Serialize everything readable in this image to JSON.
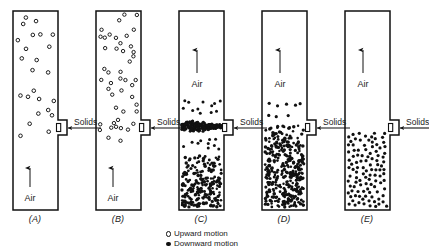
{
  "figure": {
    "background": "#ffffff",
    "ink_color": "#1a1a1a",
    "wall_color": "#111111"
  },
  "legend": {
    "items": [
      {
        "marker": "open-circle",
        "label": "Upward motion"
      },
      {
        "marker": "filled-circle",
        "label": "Downward motion"
      }
    ]
  },
  "labels": {
    "air": "Air",
    "solids": "Solids"
  },
  "panels": [
    {
      "id": "A",
      "caption": "(A)",
      "vessel": {
        "x": 13,
        "y": 11,
        "width": 45,
        "height": 199
      },
      "notch": {
        "x": 58,
        "y": 120,
        "width": 9,
        "height": 15
      },
      "solids_label": {
        "x": 74,
        "y": 117
      },
      "solids_line": {
        "x1": 67,
        "y1": 128,
        "x2": 101,
        "y2": 128
      },
      "air_arrow": {
        "x": 30,
        "y1": 196,
        "y2": 168
      },
      "air_label": {
        "x": 30,
        "y": 196
      },
      "caption_pos": {
        "x": 35,
        "y": 214
      },
      "particles": {
        "style": "open",
        "regions": [
          {
            "type": "sparse",
            "x": 14,
            "y": 12,
            "width": 43,
            "height": 128,
            "count": 24,
            "radius": 1.8
          }
        ]
      }
    },
    {
      "id": "B",
      "caption": "(B)",
      "vessel": {
        "x": 96,
        "y": 11,
        "width": 45,
        "height": 199
      },
      "notch": {
        "x": 141,
        "y": 120,
        "width": 9,
        "height": 15
      },
      "solids_label": {
        "x": 157,
        "y": 117
      },
      "solids_line": {
        "x1": 150,
        "y1": 128,
        "x2": 184,
        "y2": 128
      },
      "air_arrow": {
        "x": 113,
        "y1": 196,
        "y2": 168
      },
      "air_label": {
        "x": 113,
        "y": 196
      },
      "caption_pos": {
        "x": 118,
        "y": 214
      },
      "particles": {
        "style": "open",
        "regions": [
          {
            "type": "sparse",
            "x": 97,
            "y": 12,
            "width": 43,
            "height": 132,
            "count": 46,
            "radius": 1.7
          }
        ]
      }
    },
    {
      "id": "C",
      "caption": "(C)",
      "vessel": {
        "x": 179,
        "y": 11,
        "width": 45,
        "height": 199
      },
      "notch": {
        "x": 224,
        "y": 120,
        "width": 9,
        "height": 15
      },
      "solids_label": {
        "x": 240,
        "y": 117
      },
      "solids_line": {
        "x1": 233,
        "y1": 128,
        "x2": 267,
        "y2": 128
      },
      "air_arrow": {
        "x": 197,
        "y1": 82,
        "y2": 50
      },
      "air_label": {
        "x": 197,
        "y": 82
      },
      "caption_pos": {
        "x": 201,
        "y": 214
      },
      "particles": {
        "style": "filled",
        "regions": [
          {
            "type": "sparse",
            "x": 180,
            "y": 98,
            "width": 43,
            "height": 20,
            "count": 12,
            "radius": 1.5
          },
          {
            "type": "streak",
            "x": 180,
            "y": 118,
            "width": 43,
            "height": 18,
            "count": 230,
            "radius": 1.35
          },
          {
            "type": "sparse",
            "x": 180,
            "y": 136,
            "width": 43,
            "height": 18,
            "count": 10,
            "radius": 1.5
          },
          {
            "type": "dense",
            "x": 180,
            "y": 154,
            "width": 43,
            "height": 55,
            "count": 215,
            "radius": 1.45
          }
        ]
      }
    },
    {
      "id": "D",
      "caption": "(D)",
      "vessel": {
        "x": 262,
        "y": 11,
        "width": 45,
        "height": 199
      },
      "notch": {
        "x": 307,
        "y": 120,
        "width": 9,
        "height": 15
      },
      "solids_label": {
        "x": 323,
        "y": 117
      },
      "solids_line": {
        "x1": 316,
        "y1": 128,
        "x2": 350,
        "y2": 128
      },
      "air_arrow": {
        "x": 280,
        "y1": 82,
        "y2": 50
      },
      "air_label": {
        "x": 280,
        "y": 82
      },
      "caption_pos": {
        "x": 284,
        "y": 214
      },
      "particles": {
        "style": "filled",
        "regions": [
          {
            "type": "sparse",
            "x": 263,
            "y": 98,
            "width": 43,
            "height": 22,
            "count": 8,
            "radius": 1.6
          },
          {
            "type": "dense",
            "x": 263,
            "y": 124,
            "width": 43,
            "height": 85,
            "count": 360,
            "radius": 1.45
          }
        ]
      }
    },
    {
      "id": "E",
      "caption": "(E)",
      "vessel": {
        "x": 345,
        "y": 11,
        "width": 45,
        "height": 199
      },
      "notch": {
        "x": 390,
        "y": 120,
        "width": 9,
        "height": 15
      },
      "solids_label": {
        "x": 406,
        "y": 117
      },
      "solids_line": {
        "x1": 399,
        "y1": 128,
        "x2": 429,
        "y2": 128
      },
      "air_arrow": {
        "x": 363,
        "y1": 82,
        "y2": 50
      },
      "air_label": {
        "x": 363,
        "y": 82
      },
      "caption_pos": {
        "x": 367,
        "y": 214
      },
      "particles": {
        "style": "filled",
        "regions": [
          {
            "type": "medium",
            "x": 346,
            "y": 131,
            "width": 43,
            "height": 78,
            "count": 105,
            "radius": 1.7
          }
        ]
      }
    }
  ]
}
